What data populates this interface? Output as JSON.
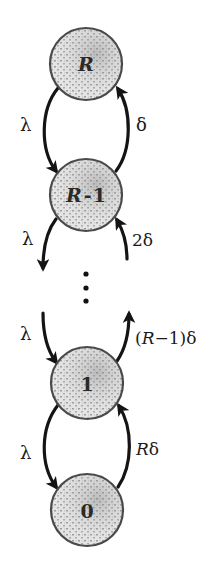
{
  "diagram": {
    "type": "birth-death state transition chain",
    "nodes": [
      {
        "id": "R",
        "label": "R",
        "cx": 86,
        "cy": 64
      },
      {
        "id": "R-1",
        "label": "R - 1",
        "cx": 86,
        "cy": 195
      },
      {
        "id": "1",
        "label": "1",
        "cx": 87,
        "cy": 383
      },
      {
        "id": "0",
        "label": "0",
        "cx": 87,
        "cy": 510
      }
    ],
    "ellipsis": "⋮",
    "edges": [
      {
        "from": "R",
        "to": "R-1",
        "side": "left",
        "label": "λ"
      },
      {
        "from": "R-1",
        "to": "R",
        "side": "right",
        "label": "δ"
      },
      {
        "from": "R-1",
        "to": "…",
        "side": "left",
        "label": "λ"
      },
      {
        "from": "…",
        "to": "R-1",
        "side": "right",
        "label": "2δ"
      },
      {
        "from": "…",
        "to": "1",
        "side": "left",
        "label": "λ"
      },
      {
        "from": "1",
        "to": "…",
        "side": "right",
        "label": "(R−1)δ"
      },
      {
        "from": "1",
        "to": "0",
        "side": "left",
        "label": "λ"
      },
      {
        "from": "0",
        "to": "1",
        "side": "right",
        "label": "Rδ"
      }
    ],
    "labels": {
      "node_R": "R",
      "node_R1_R": "R",
      "node_R1_minus": "-",
      "node_R1_one": "1",
      "node_1": "1",
      "node_0": "0",
      "lambda_1": "λ",
      "delta_1": "δ",
      "lambda_2": "λ",
      "delta_2": "2δ",
      "lambda_3": "λ",
      "delta_3_open": "(",
      "delta_3_R": "R",
      "delta_3_rest": "−1)δ",
      "lambda_4": "λ",
      "delta_4_R": "R",
      "delta_4_rest": "δ"
    },
    "colors": {
      "edge": "#141414",
      "node_stroke": "#4a4a4a",
      "node_fill": "#d9d9d9"
    }
  }
}
